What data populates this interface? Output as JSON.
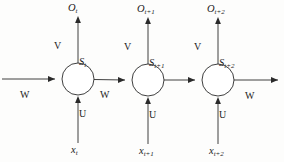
{
  "figure": {
    "type": "diagram",
    "width": 284,
    "height": 162,
    "background_color": "#fdfdfc",
    "stroke_color": "#2a2a2a"
  },
  "weights": {
    "input_label": "U",
    "output_label": "V",
    "recurrent_label": "W"
  },
  "timesteps": [
    {
      "id": "t",
      "state_label": "S",
      "state_sub": "t",
      "output_label": "O",
      "output_sub": "t",
      "input_label": "x",
      "input_sub": "t",
      "cx": 78,
      "cy": 79,
      "r": 16
    },
    {
      "id": "t+1",
      "state_label": "S",
      "state_sub": "t+1",
      "output_label": "O",
      "output_sub": "t+1",
      "input_label": "x",
      "input_sub": "t+1",
      "cx": 148,
      "cy": 80,
      "r": 16
    },
    {
      "id": "t+2",
      "state_label": "S",
      "state_sub": "t+2",
      "output_label": "O",
      "output_sub": "t+2",
      "input_label": "x",
      "input_sub": "t+2",
      "cx": 218,
      "cy": 80,
      "r": 16
    }
  ],
  "recurrent_edges": [
    {
      "label": "W",
      "x": 25,
      "y": 96
    },
    {
      "label": "W",
      "x": 105,
      "y": 96
    },
    {
      "label": "W",
      "x": 250,
      "y": 97
    }
  ],
  "output_weight_labels": [
    {
      "label": "V",
      "x": 57,
      "y": 46
    },
    {
      "label": "V",
      "x": 127,
      "y": 47
    },
    {
      "label": "V",
      "x": 197,
      "y": 47
    }
  ],
  "input_weight_labels": [
    {
      "label": "U",
      "x": 81,
      "y": 114
    },
    {
      "label": "U",
      "x": 151,
      "y": 115
    },
    {
      "label": "U",
      "x": 221,
      "y": 115
    }
  ]
}
